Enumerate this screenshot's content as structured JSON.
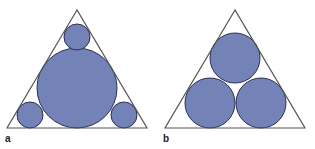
{
  "panels": [
    {
      "label": "a",
      "triangle": [
        [
          77,
          10
        ],
        [
          7,
          128
        ],
        [
          147,
          128
        ]
      ],
      "circles": [
        {
          "cx": 77,
          "cy": 88,
          "r": 40
        },
        {
          "cx": 77,
          "cy": 37,
          "r": 13
        },
        {
          "cx": 30,
          "cy": 115,
          "r": 13
        },
        {
          "cx": 124,
          "cy": 115,
          "r": 13
        }
      ]
    },
    {
      "label": "b",
      "triangle": [
        [
          235,
          10
        ],
        [
          165,
          128
        ],
        [
          305,
          128
        ]
      ],
      "circles": [
        {
          "cx": 235,
          "cy": 58,
          "r": 25
        },
        {
          "cx": 210,
          "cy": 103,
          "r": 25
        },
        {
          "cx": 261,
          "cy": 103,
          "r": 25
        }
      ]
    }
  ],
  "colors": {
    "circle_fill": "#7383b8",
    "circle_stroke": "#2a3050",
    "triangle_stroke": "#555555",
    "background": "#ffffff"
  }
}
